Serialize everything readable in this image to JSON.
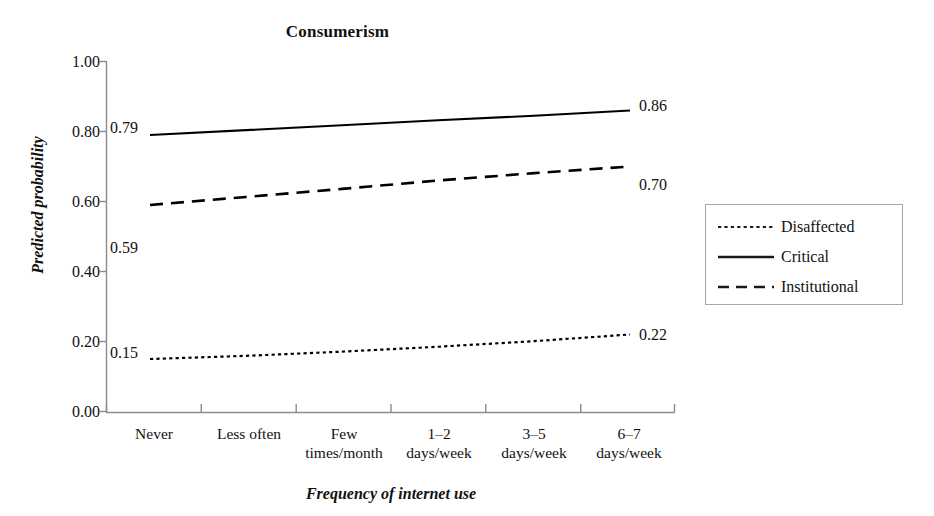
{
  "chart_data": {
    "type": "line",
    "title": "Consumerism",
    "xlabel": "Frequency of internet use",
    "ylabel": "Predicted probability",
    "categories": [
      "Never",
      "Less often",
      "Few times/month",
      "1–2 days/week",
      "3–5 days/week",
      "6–7 days/week"
    ],
    "category_lines": [
      [
        "Never",
        ""
      ],
      [
        "Less often",
        ""
      ],
      [
        "Few",
        "times/month"
      ],
      [
        "1–2",
        "days/week"
      ],
      [
        "3–5",
        "days/week"
      ],
      [
        "6–7",
        "days/week"
      ]
    ],
    "ylim": [
      0.0,
      1.0
    ],
    "ytick_labels": [
      "1.00",
      "0.80",
      "0.60",
      "0.40",
      "0.20",
      "0.00"
    ],
    "ytick_values": [
      1.0,
      0.8,
      0.6,
      0.4,
      0.2,
      0.0
    ],
    "grid": false,
    "legend_position": "right",
    "series": [
      {
        "name": "Disaffected",
        "style": "dotted",
        "color": "#000000",
        "values": [
          0.15,
          0.159,
          0.171,
          0.185,
          0.201,
          0.22
        ],
        "start_label": "0.15",
        "end_label": "0.22"
      },
      {
        "name": "Critical",
        "style": "solid",
        "color": "#000000",
        "values": [
          0.79,
          0.804,
          0.818,
          0.832,
          0.845,
          0.86
        ],
        "start_label": "0.79",
        "end_label": "0.86"
      },
      {
        "name": "Institutional",
        "style": "dashed",
        "color": "#000000",
        "values": [
          0.59,
          0.613,
          0.636,
          0.66,
          0.681,
          0.7
        ],
        "start_label": "0.59",
        "end_label": "0.70"
      }
    ]
  },
  "legend": {
    "items": [
      {
        "label": "Disaffected",
        "style": "dotted"
      },
      {
        "label": "Critical",
        "style": "solid"
      },
      {
        "label": "Institutional",
        "style": "dashed"
      }
    ]
  },
  "axis": {
    "y_labels": [
      "1.00",
      "0.80",
      "0.60",
      "0.40",
      "0.20",
      "0.00"
    ],
    "x_labels_line1": [
      "Never",
      "Less often",
      "Few",
      "1–2",
      "3–5",
      "6–7"
    ],
    "x_labels_line2": [
      "",
      "",
      "times/month",
      "days/week",
      "days/week",
      "days/week"
    ]
  },
  "value_labels": {
    "critical_start": "0.79",
    "critical_end": "0.86",
    "institutional_start": "0.59",
    "institutional_end": "0.70",
    "disaffected_start": "0.15",
    "disaffected_end": "0.22"
  },
  "colors": {
    "axis": "#8c8c8c",
    "line": "#1a1a1a",
    "legend_border": "#a6a6a6",
    "text": "#111111",
    "background": "#ffffff"
  }
}
